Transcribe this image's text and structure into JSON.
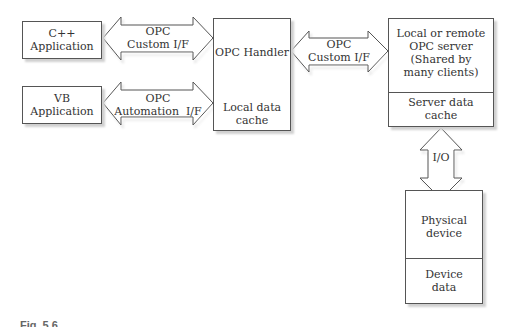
{
  "diagram": {
    "nodes": {
      "cpp_app": {
        "line1": "C++",
        "line2": "Application"
      },
      "vb_app": {
        "line1": "VB",
        "line2": "Application"
      },
      "opc_handler": {
        "top": "OPC Handler",
        "bottom_line1": "Local data",
        "bottom_line2": "cache"
      },
      "opc_server": {
        "line1": "Local or remote",
        "line2": "OPC server",
        "line3": "(Shared by",
        "line4": "many clients)",
        "bottom_line1": "Server data",
        "bottom_line2": "cache"
      },
      "physical_device": {
        "line1": "Physical",
        "line2": "device",
        "bottom_line1": "Device",
        "bottom_line2": "data"
      }
    },
    "edges": {
      "cpp_to_handler": {
        "line1": "OPC",
        "line2": "Custom I/F"
      },
      "vb_to_handler": {
        "line1": "OPC",
        "line2": "Automation  I/F"
      },
      "handler_to_server": {
        "line1": "OPC",
        "line2": "Custom I/F"
      },
      "server_to_device": {
        "label": "I/O"
      }
    },
    "caption": "Fig. 5.6"
  }
}
